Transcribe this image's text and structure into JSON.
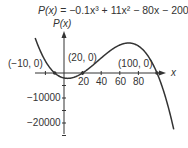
{
  "chart_data": {
    "type": "line",
    "title": "P(x) = −0.1x³ + 11x² − 80x − 2000",
    "function": {
      "a3": -0.1,
      "a2": 11,
      "a1": -80,
      "a0": -2000
    },
    "xlabel": "x",
    "ylabel": "P(x)",
    "x_range": [
      -31,
      119
    ],
    "xlim_drawn": [
      -31,
      110
    ],
    "ylim": [
      -25000,
      14000
    ],
    "x_ticks": [
      20,
      40,
      60,
      80
    ],
    "x_tick_labels": [
      "20",
      "40",
      "60",
      "80"
    ],
    "y_ticks": [
      -10000,
      -20000
    ],
    "y_tick_labels": [
      "−10000",
      "−20000"
    ],
    "annotations": [
      {
        "text": "(−10, 0)",
        "x": -10,
        "y": 0
      },
      {
        "text": "(20, 0)",
        "x": 20,
        "y": 0
      },
      {
        "text": "(100, 0)",
        "x": 100,
        "y": 0
      }
    ],
    "roots": [
      -10,
      20,
      100
    ],
    "grid": false,
    "line_color": "#333333"
  },
  "equation": {
    "lhs": "P(x)",
    "rhs": " = −0.1x³ + 11x² − 80x − 2000"
  },
  "axes": {
    "x_label": "x",
    "y_label": "P(x)"
  },
  "labels": {
    "root_neg10": "(−10, 0)",
    "root_20": "(20, 0)",
    "root_100": "(100, 0)",
    "tick_20": "20",
    "tick_40": "40",
    "tick_60": "60",
    "tick_80": "80",
    "tick_neg10000": "−10000",
    "tick_neg20000": "−20000"
  }
}
